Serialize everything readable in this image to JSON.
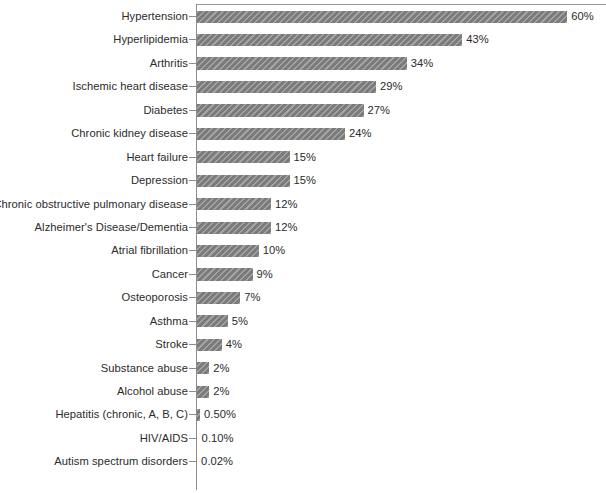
{
  "chart_data": {
    "type": "bar",
    "orientation": "horizontal",
    "title": "",
    "subtitle": "",
    "xlabel": "",
    "ylabel": "",
    "xlim": [
      0,
      66
    ],
    "grid": false,
    "legend": null,
    "bar_color": "#7b7b7b",
    "bar_pattern": "diagonal-hatch",
    "label_color": "#2b2b2b",
    "axis_color": "#8c8c8c",
    "categories": [
      "Hypertension",
      "Hyperlipidemia",
      "Arthritis",
      "Ischemic heart disease",
      "Diabetes",
      "Chronic kidney disease",
      "Heart failure",
      "Depression",
      "Chronic obstructive pulmonary disease",
      "Alzheimer's Disease/Dementia",
      "Atrial fibrillation",
      "Cancer",
      "Osteoporosis",
      "Asthma",
      "Stroke",
      "Substance abuse",
      "Alcohol abuse",
      "Hepatitis (chronic, A, B, C)",
      "HIV/AIDS",
      "Autism spectrum disorders"
    ],
    "values": [
      60,
      43,
      34,
      29,
      27,
      24,
      15,
      15,
      12,
      12,
      10,
      9,
      7,
      5,
      4,
      2,
      2,
      0.5,
      0.1,
      0.02
    ],
    "value_labels": [
      "60%",
      "43%",
      "34%",
      "29%",
      "27%",
      "24%",
      "15%",
      "15%",
      "12%",
      "12%",
      "10%",
      "9%",
      "7%",
      "5%",
      "4%",
      "2%",
      "2%",
      "0.50%",
      "0.10%",
      "0.02%"
    ]
  }
}
